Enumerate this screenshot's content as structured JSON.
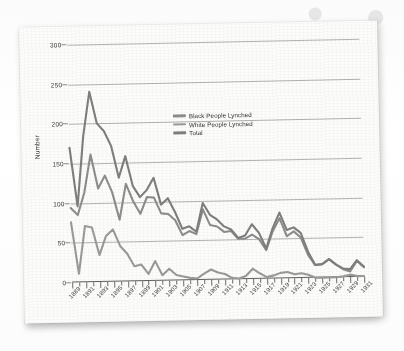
{
  "figure": {
    "media": "scanned-page",
    "paper_color": "#fcfcfb",
    "line_color": "#8f8f8f",
    "grid_color": "#9a9a9a",
    "axis_color": "#5f5f5f"
  },
  "legend": {
    "position": "inside-upper-right",
    "entries": [
      {
        "label": "Black People Lynched",
        "color": "#8d8d8d"
      },
      {
        "label": "White People Lynched",
        "color": "#9a9a9a"
      },
      {
        "label": "Total",
        "color": "#7e7e7e"
      }
    ]
  },
  "axes": {
    "y_title": "Number",
    "y_ticks": [
      "0",
      "50",
      "100",
      "150",
      "200",
      "250",
      "300"
    ],
    "x_tick_labels": [
      "1889",
      "1891",
      "1893",
      "1895",
      "1897",
      "1899",
      "1901",
      "1903",
      "1905",
      "1907",
      "1909",
      "1911",
      "1913",
      "1915",
      "1917",
      "1919",
      "1921",
      "1923",
      "1925",
      "1927",
      "1929",
      "1931"
    ]
  },
  "chart_data": {
    "type": "line",
    "title": "",
    "xlabel": "",
    "ylabel": "Number",
    "ylim": [
      0,
      300
    ],
    "xlim": [
      1889,
      1931
    ],
    "grid": true,
    "legend_position": "inside-upper-right",
    "x": [
      1889,
      1890,
      1891,
      1892,
      1893,
      1894,
      1895,
      1896,
      1897,
      1898,
      1899,
      1900,
      1901,
      1902,
      1903,
      1904,
      1905,
      1906,
      1907,
      1908,
      1909,
      1910,
      1911,
      1912,
      1913,
      1914,
      1915,
      1916,
      1917,
      1918,
      1919,
      1920,
      1921,
      1922,
      1923,
      1924,
      1925,
      1926,
      1927,
      1928,
      1929,
      1930,
      1931
    ],
    "series": [
      {
        "name": "Total",
        "color": "#7e7e7e",
        "values": [
          170,
          96,
          184,
          240,
          200,
          190,
          171,
          131,
          158,
          120,
          106,
          115,
          130,
          96,
          104,
          86,
          65,
          68,
          61,
          97,
          82,
          76,
          67,
          63,
          52,
          55,
          69,
          58,
          38,
          64,
          83,
          61,
          64,
          57,
          33,
          16,
          17,
          23,
          16,
          11,
          10,
          21,
          13
        ]
      },
      {
        "name": "Black People Lynched",
        "color": "#8d8d8d",
        "values": [
          94,
          85,
          113,
          161,
          118,
          134,
          113,
          78,
          123,
          101,
          85,
          106,
          105,
          85,
          84,
          76,
          57,
          62,
          58,
          89,
          69,
          67,
          60,
          61,
          51,
          51,
          56,
          50,
          36,
          60,
          76,
          53,
          59,
          51,
          29,
          16,
          17,
          23,
          16,
          10,
          7,
          20,
          12
        ]
      },
      {
        "name": "White People Lynched",
        "color": "#9a9a9a",
        "values": [
          76,
          11,
          71,
          69,
          34,
          58,
          66,
          45,
          35,
          19,
          21,
          9,
          25,
          7,
          15,
          7,
          5,
          3,
          2,
          8,
          13,
          9,
          7,
          2,
          1,
          4,
          13,
          7,
          2,
          4,
          7,
          8,
          5,
          6,
          4,
          0,
          0,
          0,
          0,
          1,
          3,
          1,
          1
        ]
      }
    ]
  }
}
